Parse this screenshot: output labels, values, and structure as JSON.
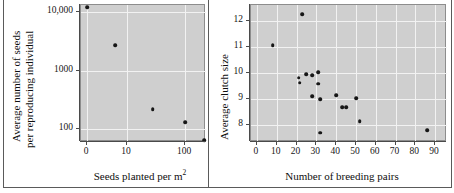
{
  "figure": {
    "name": "two-panel-scatter-figure",
    "panel_count": 2,
    "background_color": "#ffffff",
    "plot_background_color": "#cfcfcf",
    "grid_color": "#f2f2f2",
    "point_color": "#161616",
    "axis_color": "#4a4a4a"
  },
  "chart_data": [
    {
      "type": "scatter",
      "panel": "left",
      "title": "",
      "xlabel": "Seeds planted per m2",
      "xlabel_display": "Seeds planted per m",
      "xlabel_superscript": "2",
      "ylabel": "Average number of seeds per reproducing individual",
      "ylabel_line1": "Average number of seeds",
      "ylabel_line2": "per reproducing individual",
      "yscale": "log",
      "xscale": "pseudo-log",
      "grid": true,
      "legend": "none",
      "xticks": [
        "0",
        "10",
        "100"
      ],
      "xtick_values": [
        0,
        10,
        100
      ],
      "yticks": [
        "100",
        "1000",
        "10,000"
      ],
      "ytick_values": [
        100,
        1000,
        10000
      ],
      "ylim": [
        55,
        14000
      ],
      "points": [
        {
          "x": 0,
          "y": 12000
        },
        {
          "x": 7,
          "y": 2700
        },
        {
          "x": 50,
          "y": 220
        },
        {
          "x": 100,
          "y": 130
        },
        {
          "x": 130,
          "y": 65
        }
      ]
    },
    {
      "type": "scatter",
      "panel": "right",
      "title": "",
      "xlabel": "Number of breeding pairs",
      "ylabel": "Average clutch size",
      "yscale": "linear",
      "xscale": "linear",
      "grid": true,
      "legend": "none",
      "xticks": [
        "0",
        "10",
        "20",
        "30",
        "40",
        "50",
        "60",
        "70",
        "80",
        "90"
      ],
      "xtick_values": [
        0,
        10,
        20,
        30,
        40,
        50,
        60,
        70,
        80,
        90
      ],
      "yticks": [
        "8",
        "9",
        "10",
        "11",
        "12"
      ],
      "ytick_values": [
        8,
        9,
        10,
        11,
        12
      ],
      "xlim": [
        -3,
        96
      ],
      "ylim": [
        7.35,
        12.6
      ],
      "points": [
        {
          "x": 8,
          "y": 11.05
        },
        {
          "x": 23,
          "y": 12.25
        },
        {
          "x": 21,
          "y": 9.82
        },
        {
          "x": 21.5,
          "y": 9.62
        },
        {
          "x": 25,
          "y": 9.95
        },
        {
          "x": 28,
          "y": 9.9
        },
        {
          "x": 31,
          "y": 10.02
        },
        {
          "x": 31,
          "y": 9.58
        },
        {
          "x": 28,
          "y": 9.1
        },
        {
          "x": 32,
          "y": 8.98
        },
        {
          "x": 40,
          "y": 9.15
        },
        {
          "x": 43,
          "y": 8.68
        },
        {
          "x": 45,
          "y": 8.68
        },
        {
          "x": 50,
          "y": 9.02
        },
        {
          "x": 52,
          "y": 8.15
        },
        {
          "x": 32,
          "y": 7.7
        },
        {
          "x": 86,
          "y": 7.8
        }
      ]
    }
  ]
}
